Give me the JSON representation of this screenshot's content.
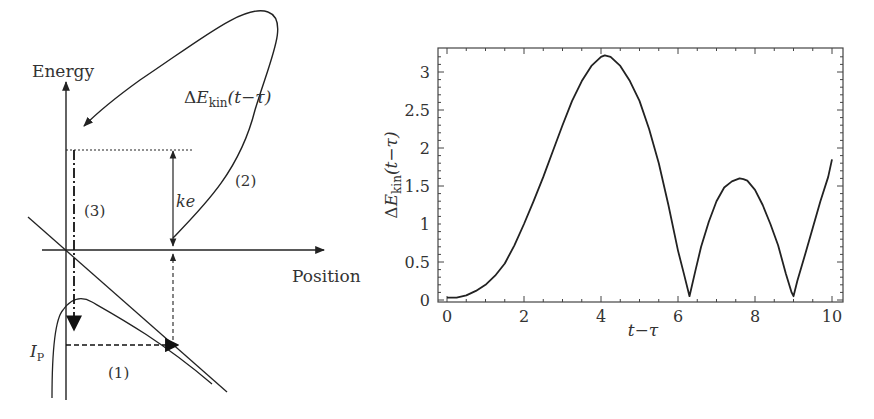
{
  "left_diagram": {
    "y_axis_label": "Energy",
    "x_axis_label": "Position",
    "curve_label_prefix": "Δ",
    "curve_label_E": "E",
    "curve_label_sub": "kin",
    "curve_label_args": "(t−τ)",
    "ke_label": "ke",
    "ip_label_I": "I",
    "ip_label_sub": "P",
    "step_labels": [
      "(1)",
      "(2)",
      "(3)"
    ]
  },
  "chart_data": {
    "type": "line",
    "title": "",
    "xlabel": "t−τ",
    "ylabel": "ΔE_kin(t−τ)",
    "ylabel_parts": {
      "delta": "Δ",
      "E": "E",
      "sub": "kin",
      "args": "(t−τ)"
    },
    "xlim": [
      -0.5,
      10.2
    ],
    "ylim": [
      -0.05,
      3.3
    ],
    "xticks": [
      0,
      2,
      4,
      6,
      8,
      10
    ],
    "yticks": [
      0,
      0.5,
      1,
      1.5,
      2,
      2.5,
      3
    ],
    "xtick_labels": [
      "0",
      "2",
      "4",
      "6",
      "8",
      "10"
    ],
    "ytick_labels": [
      "0",
      "0.5",
      "1",
      "1.5",
      "2",
      "2.5",
      "3"
    ],
    "grid": false,
    "legend": null,
    "series": [
      {
        "name": "ΔE_kin",
        "x": [
          0,
          0.25,
          0.5,
          0.75,
          1.0,
          1.25,
          1.5,
          1.75,
          2.0,
          2.25,
          2.5,
          2.75,
          3.0,
          3.25,
          3.5,
          3.75,
          4.0,
          4.1,
          4.25,
          4.5,
          4.75,
          5.0,
          5.25,
          5.5,
          5.75,
          6.0,
          6.15,
          6.3,
          6.45,
          6.6,
          6.8,
          7.0,
          7.2,
          7.4,
          7.6,
          7.7,
          7.8,
          8.0,
          8.2,
          8.4,
          8.6,
          8.8,
          8.95,
          9.0,
          9.1,
          9.3,
          9.5,
          9.7,
          9.9,
          10.0
        ],
        "y": [
          0.03,
          0.03,
          0.06,
          0.12,
          0.2,
          0.32,
          0.48,
          0.72,
          1.0,
          1.3,
          1.62,
          1.96,
          2.3,
          2.62,
          2.88,
          3.08,
          3.2,
          3.22,
          3.2,
          3.08,
          2.88,
          2.62,
          2.25,
          1.8,
          1.25,
          0.65,
          0.35,
          0.05,
          0.38,
          0.7,
          1.03,
          1.3,
          1.48,
          1.56,
          1.6,
          1.59,
          1.57,
          1.45,
          1.25,
          1.0,
          0.72,
          0.35,
          0.1,
          0.05,
          0.25,
          0.6,
          0.95,
          1.3,
          1.62,
          1.85
        ]
      }
    ]
  }
}
